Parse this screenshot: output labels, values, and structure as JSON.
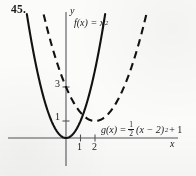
{
  "figure": {
    "problem_number": "45.",
    "background_color": "#fbfbfa",
    "ink_color": "#1a1a1a",
    "axis_color": "#55565a"
  },
  "axes": {
    "x_label": "x",
    "y_label": "y",
    "x_ticks": [
      "1",
      "2"
    ],
    "y_ticks": [
      "3",
      "1"
    ],
    "origin_px": [
      66,
      138
    ],
    "unit_px": [
      14.5,
      17.0
    ]
  },
  "labels": {
    "f": {
      "prefix": "f(x) = x",
      "exponent": "2"
    },
    "g": {
      "prefix": "g(x) = ",
      "frac_num": "1",
      "frac_den": "2",
      "mid": "(x − 2)",
      "exponent": "2",
      "suffix": " + 1"
    }
  },
  "chart_data": {
    "type": "line",
    "title": "",
    "xlabel": "x",
    "ylabel": "y",
    "xlim": [
      -4.0,
      7.7
    ],
    "ylim": [
      -1.7,
      7.5
    ],
    "grid": false,
    "legend": "inline-annotations",
    "x_ticks": [
      1,
      2
    ],
    "y_ticks": [
      1,
      3
    ],
    "series": [
      {
        "name": "f(x) = x^2",
        "style": "solid",
        "equation": "f(x) = x^2",
        "vertex": [
          0,
          0
        ],
        "a": 1,
        "x": [
          -2.6,
          -2.2,
          -1.8,
          -1.4,
          -1.0,
          -0.6,
          -0.2,
          0,
          0.2,
          0.6,
          1.0,
          1.4,
          1.8,
          2.2,
          2.6
        ],
        "y": [
          6.76,
          4.84,
          3.24,
          1.96,
          1.0,
          0.36,
          0.04,
          0,
          0.04,
          0.36,
          1.0,
          1.96,
          3.24,
          4.84,
          6.76
        ]
      },
      {
        "name": "g(x) = 1/2 (x - 2)^2 + 1",
        "style": "dashed",
        "equation": "g(x) = 0.5(x - 2)^2 + 1",
        "vertex": [
          2,
          1
        ],
        "a": 0.5,
        "x": [
          -1.4,
          -1.0,
          -0.5,
          0,
          0.5,
          1.0,
          1.5,
          2.0,
          2.5,
          3.0,
          3.5,
          4.0,
          4.5,
          5.0,
          5.4
        ],
        "y": [
          6.78,
          5.5,
          4.13,
          3.0,
          2.13,
          1.5,
          1.13,
          1.0,
          1.13,
          1.5,
          2.13,
          3.0,
          4.13,
          5.5,
          6.78
        ]
      }
    ],
    "annotations": [
      {
        "text": "f(x) = x^2",
        "x": 0.6,
        "y": 6.7
      },
      {
        "text": "g(x) = 1/2 (x - 2)^2 + 1",
        "x": 2.4,
        "y": 0.85
      }
    ]
  }
}
